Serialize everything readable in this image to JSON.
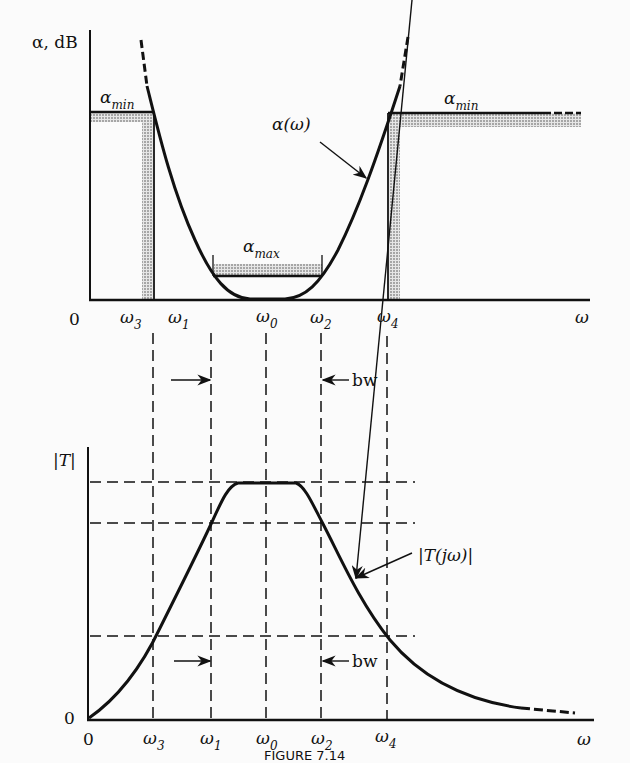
{
  "figure": {
    "caption": "FIGURE 7.14"
  },
  "top_chart": {
    "y_axis_label": "α, dB",
    "origin_label": "0",
    "x_axis_end_label": "ω",
    "curve_label": "α(ω)",
    "alpha_min_left": {
      "sym": "α",
      "sub": "min"
    },
    "alpha_min_right": {
      "sym": "α",
      "sub": "min"
    },
    "alpha_max": {
      "sym": "α",
      "sub": "max"
    },
    "ticks": [
      {
        "sym": "ω",
        "sub": "3"
      },
      {
        "sym": "ω",
        "sub": "1"
      },
      {
        "sym": "ω",
        "sub": "0"
      },
      {
        "sym": "ω",
        "sub": "2"
      },
      {
        "sym": "ω",
        "sub": "4"
      }
    ]
  },
  "middle": {
    "bw_label": "bw"
  },
  "bottom_chart": {
    "y_axis_label": "|T|",
    "y_zero_label": "0",
    "origin_label": "0",
    "x_axis_end_label": "ω",
    "curve_label": "|T(jω)|",
    "bw_label": "bw",
    "ticks": [
      {
        "sym": "ω",
        "sub": "3"
      },
      {
        "sym": "ω",
        "sub": "1"
      },
      {
        "sym": "ω",
        "sub": "0"
      },
      {
        "sym": "ω",
        "sub": "2"
      },
      {
        "sym": "ω",
        "sub": "4"
      }
    ]
  },
  "chart_data": [
    {
      "type": "line",
      "title": "Bandpass loss specification α(ω)",
      "xlabel": "ω",
      "ylabel": "α, dB",
      "x_ticks": [
        "0",
        "ω3",
        "ω1",
        "ω0",
        "ω2",
        "ω4",
        "ω"
      ],
      "regions": {
        "stopband_lower": "0 to ω3, α ≥ α_min",
        "passband": "ω1 to ω2, α ≤ α_max",
        "stopband_upper": "ω ≥ ω4, α ≥ α_min"
      },
      "series": [
        {
          "name": "α(ω)",
          "shape": "U-shaped, zero near ω0, rises above α_min at ω3 and ω4"
        }
      ]
    },
    {
      "type": "line",
      "title": "Magnitude response |T(jω)|",
      "xlabel": "ω",
      "ylabel": "|T|",
      "x_ticks": [
        "0",
        "ω3",
        "ω1",
        "ω0",
        "ω2",
        "ω4",
        "ω"
      ],
      "y_ticks": [
        "0"
      ],
      "series": [
        {
          "name": "|T(jω)|",
          "shape": "bell, flat max around ω0, crosses passband edge at ω1/ω2 and stopband level at ω3/ω4, decays to 0"
        }
      ],
      "annotations": [
        "bw (between ω1 and ω2)"
      ]
    }
  ]
}
